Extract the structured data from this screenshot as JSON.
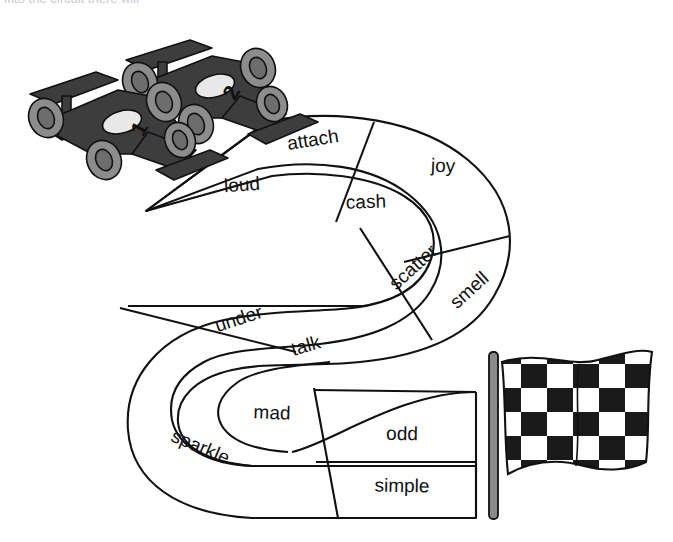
{
  "page": {
    "title_cut_off": "into the circuit there will",
    "background_color": "#ffffff"
  },
  "illustration": {
    "name": "race-track-word-worksheet",
    "line_color": "#111111",
    "car_body_color": "#3d3d3d",
    "car_wheel_color": "#8c8c8c",
    "car_accent_color": "#5a5a5a",
    "car_cockpit_color": "#e8e8e8",
    "flag_pole_color": "#8a8a8a",
    "flag_dark_color": "#1a1a1a",
    "flag_light_color": "#ffffff"
  },
  "cars": [
    {
      "name": "race-car-one",
      "number": "1"
    },
    {
      "name": "race-car-two",
      "number": "2"
    }
  ],
  "flag": {
    "name": "checkered-flag",
    "label": "checkered-flag"
  },
  "track": {
    "name": "word-race-track",
    "lane_count": 2,
    "segment_count": 12,
    "segments": [
      {
        "id": "seg-attach",
        "word": "attach",
        "lane": "outer",
        "x": 313,
        "y": 141,
        "rotate": -9
      },
      {
        "id": "seg-loud",
        "word": "loud",
        "lane": "inner",
        "x": 242,
        "y": 186,
        "rotate": -4
      },
      {
        "id": "seg-cash",
        "word": "cash",
        "lane": "inner",
        "x": 366,
        "y": 203,
        "rotate": -2
      },
      {
        "id": "seg-joy",
        "word": "joy",
        "lane": "outer",
        "x": 443,
        "y": 167,
        "rotate": 2
      },
      {
        "id": "seg-scatter",
        "word": "scatter",
        "lane": "inner",
        "x": 414,
        "y": 268,
        "rotate": -42
      },
      {
        "id": "seg-smell",
        "word": "smell",
        "lane": "outer",
        "x": 470,
        "y": 291,
        "rotate": -42
      },
      {
        "id": "seg-under",
        "word": "under",
        "lane": "outer",
        "x": 239,
        "y": 320,
        "rotate": -18
      },
      {
        "id": "seg-talk",
        "word": "talk",
        "lane": "inner",
        "x": 306,
        "y": 347,
        "rotate": -16
      },
      {
        "id": "seg-mad",
        "word": "mad",
        "lane": "inner",
        "x": 272,
        "y": 414,
        "rotate": 2
      },
      {
        "id": "seg-sparkle",
        "word": "sparkle",
        "lane": "outer",
        "x": 200,
        "y": 448,
        "rotate": 23
      },
      {
        "id": "seg-odd",
        "word": "odd",
        "lane": "outer",
        "x": 402,
        "y": 435,
        "rotate": 1
      },
      {
        "id": "seg-simple",
        "word": "simple",
        "lane": "inner",
        "x": 402,
        "y": 487,
        "rotate": 1
      }
    ]
  }
}
